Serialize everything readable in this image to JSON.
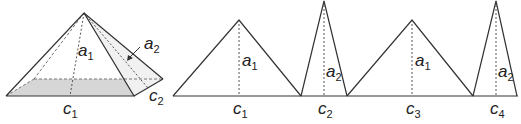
{
  "pyramid": {
    "labels": {
      "a1": {
        "base": "a",
        "sub": "1"
      },
      "a2": {
        "base": "a",
        "sub": "2"
      },
      "c1": {
        "base": "c",
        "sub": "1"
      },
      "c2": {
        "base": "c",
        "sub": "2"
      }
    },
    "base_fill": "#d9d9d9"
  },
  "net": {
    "triangles": [
      {
        "height_label": {
          "base": "a",
          "sub": "1"
        },
        "base_label": {
          "base": "c",
          "sub": "1"
        }
      },
      {
        "height_label": {
          "base": "a",
          "sub": "2"
        },
        "base_label": {
          "base": "c",
          "sub": "2"
        }
      },
      {
        "height_label": {
          "base": "a",
          "sub": "1"
        },
        "base_label": {
          "base": "c",
          "sub": "3"
        }
      },
      {
        "height_label": {
          "base": "a",
          "sub": "2"
        },
        "base_label": {
          "base": "c",
          "sub": "4"
        }
      }
    ]
  }
}
